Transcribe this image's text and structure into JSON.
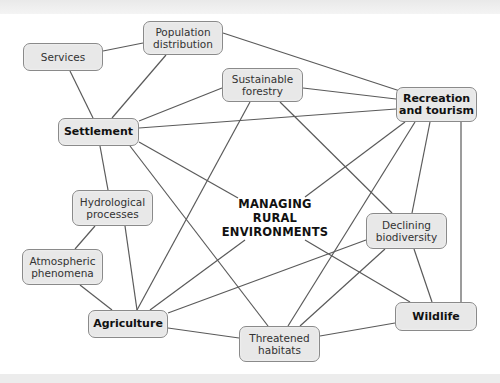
{
  "diagram": {
    "center": [
      "MANAGING",
      "RURAL",
      "ENVIRONMENTS"
    ],
    "nodes": {
      "services": {
        "label": "Services",
        "bold": false
      },
      "population": {
        "label_lines": [
          "Population",
          "distribution"
        ],
        "bold": false
      },
      "forestry": {
        "label_lines": [
          "Sustainable",
          "forestry"
        ],
        "bold": false
      },
      "recreation": {
        "label_lines": [
          "Recreation",
          "and tourism"
        ],
        "bold": true
      },
      "settlement": {
        "label": "Settlement",
        "bold": true
      },
      "hydrological": {
        "label_lines": [
          "Hydrological",
          "processes"
        ],
        "bold": false
      },
      "atmospheric": {
        "label_lines": [
          "Atmospheric",
          "phenomena"
        ],
        "bold": false
      },
      "biodiversity": {
        "label_lines": [
          "Declining",
          "biodiversity"
        ],
        "bold": false
      },
      "agriculture": {
        "label": "Agriculture",
        "bold": true
      },
      "wildlife": {
        "label": "Wildlife",
        "bold": true
      },
      "habitats": {
        "label_lines": [
          "Threatened",
          "habitats"
        ],
        "bold": false
      }
    },
    "edges": [
      [
        "services",
        "population"
      ],
      [
        "services",
        "settlement"
      ],
      [
        "population",
        "settlement"
      ],
      [
        "population",
        "recreation"
      ],
      [
        "forestry",
        "settlement"
      ],
      [
        "forestry",
        "recreation"
      ],
      [
        "forestry",
        "agriculture"
      ],
      [
        "forestry",
        "biodiversity"
      ],
      [
        "settlement",
        "recreation"
      ],
      [
        "settlement",
        "center"
      ],
      [
        "settlement",
        "habitats"
      ],
      [
        "settlement",
        "hydrological"
      ],
      [
        "recreation",
        "center"
      ],
      [
        "recreation",
        "habitats"
      ],
      [
        "recreation",
        "biodiversity"
      ],
      [
        "recreation",
        "wildlife"
      ],
      [
        "hydrological",
        "atmospheric"
      ],
      [
        "hydrological",
        "agriculture"
      ],
      [
        "atmospheric",
        "agriculture"
      ],
      [
        "agriculture",
        "center"
      ],
      [
        "agriculture",
        "biodiversity"
      ],
      [
        "agriculture",
        "habitats"
      ],
      [
        "center",
        "wildlife"
      ],
      [
        "biodiversity",
        "wildlife"
      ],
      [
        "biodiversity",
        "habitats"
      ],
      [
        "habitats",
        "wildlife"
      ]
    ],
    "colors": {
      "node_fill": "#e8e8e8",
      "node_border": "#8a8a8a",
      "edge": "#5a5a5a"
    }
  }
}
